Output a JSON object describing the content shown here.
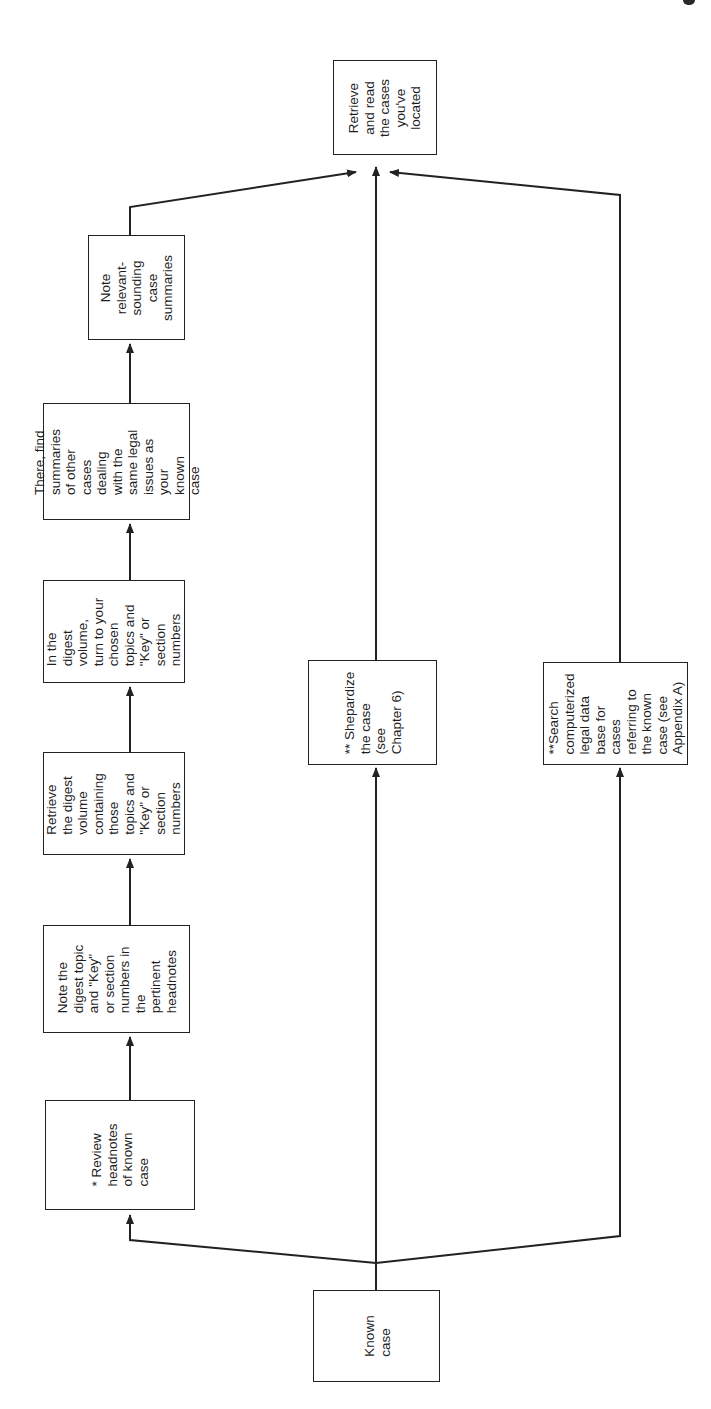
{
  "diagram": {
    "orientation": "rotated-90-ccw",
    "line_color": "#222222",
    "text_color": "#1e1e1e",
    "background": "#ffffff",
    "nodes": {
      "known_case": {
        "text": "Known\ncase"
      },
      "review_headnotes": {
        "text": "* Review\nheadnotes\nof known\ncase"
      },
      "note_digest_topic": {
        "text": "Note the\ndigest topic\nand \"Key\"\nor section\nnumbers in\nthe\npertinent\nheadnotes"
      },
      "retrieve_digest_volume": {
        "text": "Retrieve\nthe digest\nvolume\ncontaining\nthose\ntopics and\n\"Key\" or\nsection\nnumbers"
      },
      "turn_to_topics": {
        "text": "In the\ndigest\nvolume,\nturn to your\nchosen\ntopics and\n\"Key\" or\nsection\nnumbers"
      },
      "find_summaries": {
        "text": "There, find\nsummaries\nof other\ncases\ndealing\nwith the\nsame legal\nissues as\nyour\nknown\ncase"
      },
      "note_summaries": {
        "text": "Note\nrelevant-\nsounding\ncase\nsummaries"
      },
      "shepardize": {
        "text": "** Shepardize\nthe case\n(see\nChapter 6)"
      },
      "search_database": {
        "text": "**Search\ncomputerized\nlegal data\nbase for\ncases\nreferring to\nthe known\ncase (see\nAppendix A)"
      },
      "retrieve_cases": {
        "text": "Retrieve\nand read\nthe cases\nyou've\nlocated"
      }
    },
    "edges": [
      {
        "from": "known_case",
        "to": "review_headnotes"
      },
      {
        "from": "known_case",
        "to": "shepardize"
      },
      {
        "from": "known_case",
        "to": "search_database"
      },
      {
        "from": "review_headnotes",
        "to": "note_digest_topic"
      },
      {
        "from": "note_digest_topic",
        "to": "retrieve_digest_volume"
      },
      {
        "from": "retrieve_digest_volume",
        "to": "turn_to_topics"
      },
      {
        "from": "turn_to_topics",
        "to": "find_summaries"
      },
      {
        "from": "find_summaries",
        "to": "note_summaries"
      },
      {
        "from": "note_summaries",
        "to": "retrieve_cases"
      },
      {
        "from": "shepardize",
        "to": "retrieve_cases"
      },
      {
        "from": "search_database",
        "to": "retrieve_cases"
      }
    ]
  }
}
